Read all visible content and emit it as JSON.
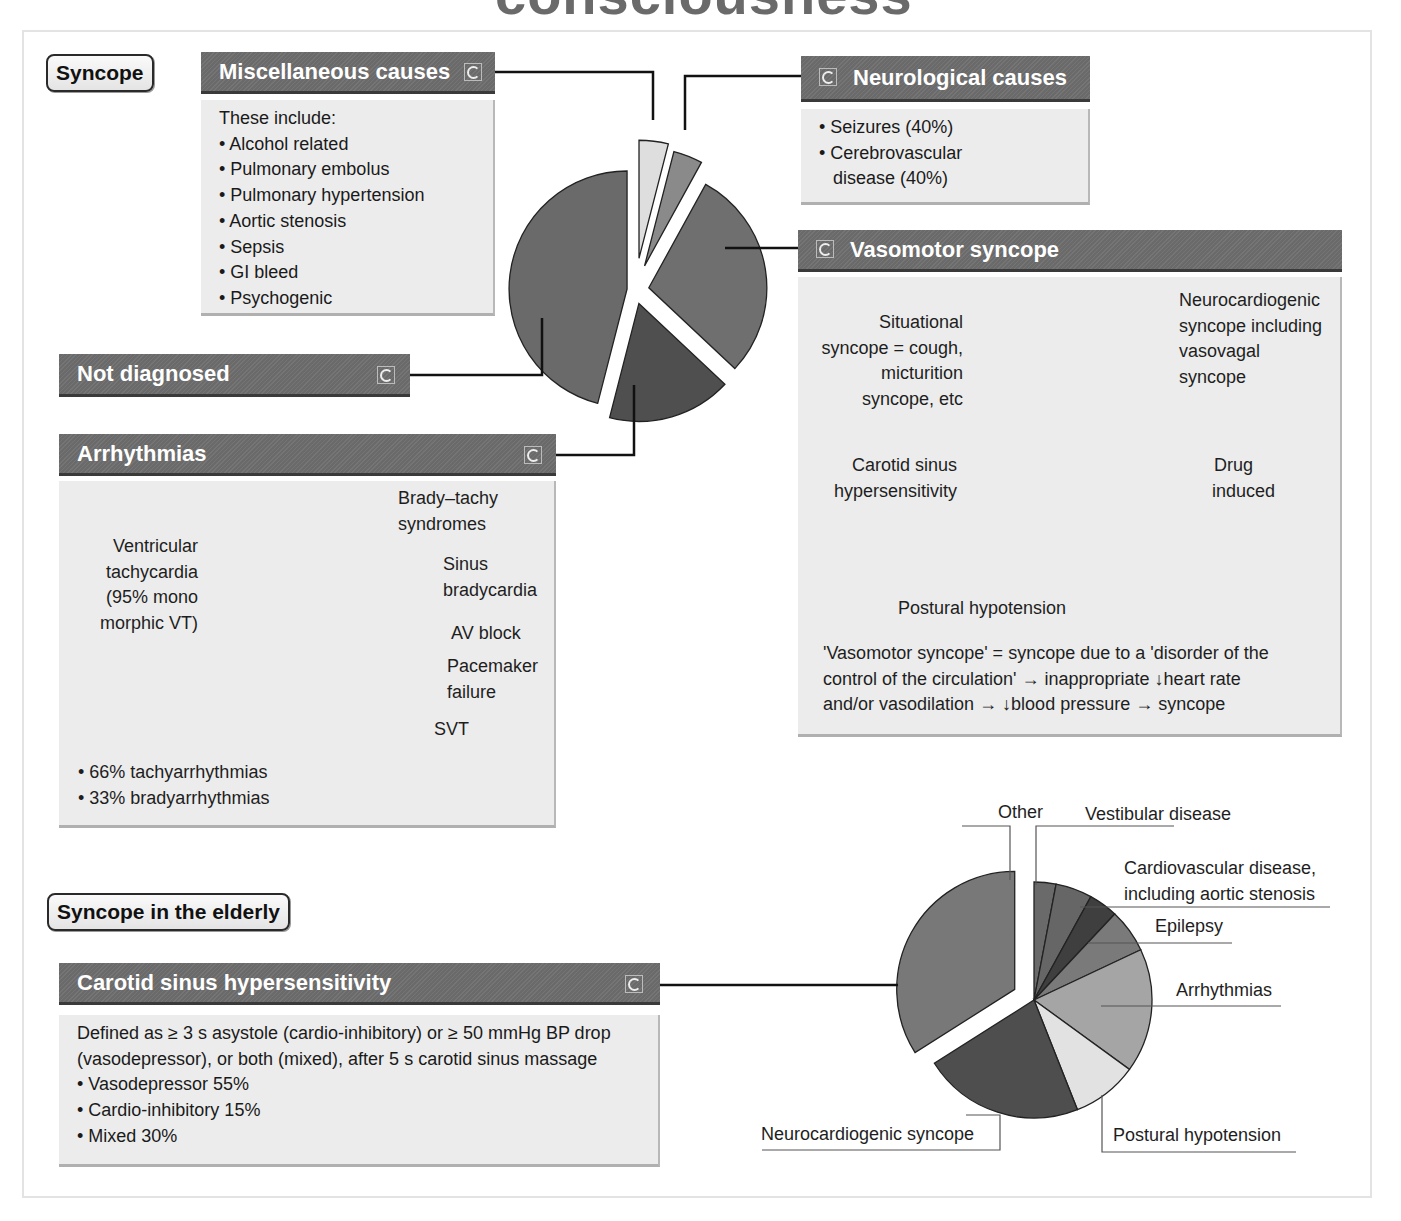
{
  "page": {
    "title_clipped": "consciousness",
    "colors": {
      "header_bg": "#6e6e6e",
      "box_bg": "#ececec",
      "slice_dark": "#4f4f4f",
      "slice_mid": "#6f6f6f",
      "slice_light": "#9a9a9a",
      "slice_pale": "#dedede"
    }
  },
  "syncope": {
    "tag": "Syncope",
    "misc": {
      "header": "Miscellaneous causes",
      "intro": "These include:",
      "items": [
        "Alcohol related",
        "Pulmonary embolus",
        "Pulmonary hypertension",
        "Aortic stenosis",
        "Sepsis",
        "GI bleed",
        "Psychogenic"
      ]
    },
    "neuro": {
      "header": "Neurological causes",
      "items": [
        "Seizures (40%)",
        "Cerebrovascular",
        "disease (40%)"
      ]
    },
    "not_diagnosed": {
      "header": "Not diagnosed"
    },
    "arrhythmias": {
      "header": "Arrhythmias",
      "labels": {
        "brady_tachy": [
          "Brady–tachy",
          "syndromes"
        ],
        "sinus": [
          "Sinus",
          "bradycardia"
        ],
        "av_block": [
          "AV block"
        ],
        "pacemaker": [
          "Pacemaker",
          "failure"
        ],
        "svt": [
          "SVT"
        ],
        "vt": [
          "Ventricular",
          "tachycardia",
          "(95% mono",
          "morphic VT)"
        ]
      },
      "bullets": [
        "66% tachyarrhythmias",
        "33% bradyarrhythmias"
      ]
    },
    "vasomotor": {
      "header": "Vasomotor syncope",
      "labels": {
        "neurocardiogenic": [
          "Neurocardiogenic",
          "syncope including",
          "vasovagal",
          "syncope"
        ],
        "situational": [
          "Situational",
          "syncope = cough,",
          "micturition",
          "syncope, etc"
        ],
        "carotid": [
          "Carotid sinus",
          "hypersensitivity"
        ],
        "drug": [
          "Drug",
          "induced"
        ],
        "postural": [
          "Postural hypotension"
        ]
      },
      "definition": [
        "'Vasomotor syncope' = syncope due to a 'disorder of the",
        "control of  the circulation' → inappropriate ↓heart rate",
        "and/or vasodilation → ↓blood pressure  → syncope"
      ]
    }
  },
  "elderly": {
    "tag": "Syncope in the elderly",
    "carotid": {
      "header": "Carotid sinus hypersensitivity",
      "definition": [
        "Defined as ≥ 3 s asystole (cardio-inhibitory) or ≥ 50 mmHg BP drop",
        "(vasodepressor), or both (mixed), after 5 s carotid sinus massage"
      ],
      "items": [
        "Vasodepressor 55%",
        "Cardio-inhibitory 15%",
        "Mixed 30%"
      ]
    },
    "labels": {
      "other": "Other",
      "vestibular": "Vestibular disease",
      "cardiovascular": [
        "Cardiovascular disease,",
        "including aortic stenosis"
      ],
      "epilepsy": "Epilepsy",
      "arrhythmias": "Arrhythmias",
      "postural": "Postural hypotension",
      "neurocardiogenic": "Neurocardiogenic syncope"
    }
  },
  "chart_data": [
    {
      "type": "pie",
      "title": "Syncope causes",
      "categories": [
        "Miscellaneous causes",
        "Neurological causes",
        "Vasomotor syncope",
        "Arrhythmias",
        "Not diagnosed"
      ],
      "values": [
        4,
        4,
        29,
        17,
        46
      ],
      "exploded": true,
      "colors": [
        "#dedede",
        "#8a8a8a",
        "#6f6f6f",
        "#4f4f4f",
        "#6a6a6a"
      ]
    },
    {
      "type": "pie",
      "title": "Arrhythmias",
      "categories": [
        "Brady–tachy syndromes",
        "Sinus bradycardia",
        "AV block",
        "Pacemaker failure",
        "SVT",
        "Ventricular tachycardia"
      ],
      "values": [
        19,
        5,
        11,
        4,
        9,
        52
      ],
      "colors": [
        "#5f5f5f",
        "#4a4a4a",
        "#5a5a5a",
        "#f0f0f0",
        "#a8a8a8",
        "#8a8a8a"
      ]
    },
    {
      "type": "pie",
      "title": "Vasomotor syncope",
      "categories": [
        "Neurocardiogenic syncope",
        "Drug induced",
        "Postural hypotension",
        "Carotid sinus hypersensitivity",
        "Situational syncope"
      ],
      "values": [
        27,
        8,
        36,
        4,
        25
      ],
      "colors": [
        "#5c5c5c",
        "#4a4a4a",
        "#626262",
        "#ececec",
        "#858585"
      ]
    },
    {
      "type": "pie",
      "title": "Syncope in the elderly",
      "categories": [
        "Other",
        "Vestibular disease",
        "Cardiovascular disease, including aortic stenosis",
        "Epilepsy",
        "Arrhythmias",
        "Postural hypotension",
        "Neurocardiogenic syncope",
        "Carotid sinus hypersensitivity"
      ],
      "values": [
        3,
        5,
        4,
        6,
        17,
        9,
        22,
        34
      ],
      "exploded_category": "Carotid sinus hypersensitivity",
      "colors": [
        "#6a6a6a",
        "#666666",
        "#3f3f3f",
        "#7a7a7a",
        "#a5a5a5",
        "#e2e2e2",
        "#4e4e4e",
        "#787878"
      ]
    }
  ]
}
